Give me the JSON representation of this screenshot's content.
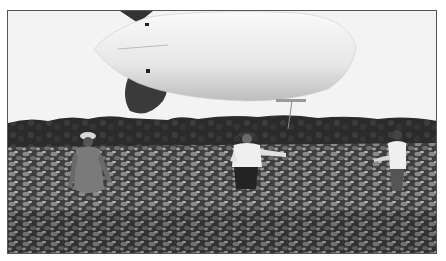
{
  "image": {
    "description": "Black-and-white photograph of a tethered white blimp (aerostat) floating low over a leafy crop field with a treeline in the background; three men stand in the field holding tether lines.",
    "colors": {
      "sky": "#f3f3f3",
      "blimp_body": "#e8e8e8",
      "blimp_fin": "#3a3a3a",
      "treeline": "#2a2a2a",
      "field": "#4a4a4a",
      "frame_border": "#555555"
    },
    "subjects": [
      {
        "name": "blimp"
      },
      {
        "name": "person-left",
        "clothing": "light cap, gray shirt"
      },
      {
        "name": "person-center",
        "clothing": "hat, white shirt, dark trousers"
      },
      {
        "name": "person-right",
        "clothing": "white shirt"
      }
    ]
  }
}
